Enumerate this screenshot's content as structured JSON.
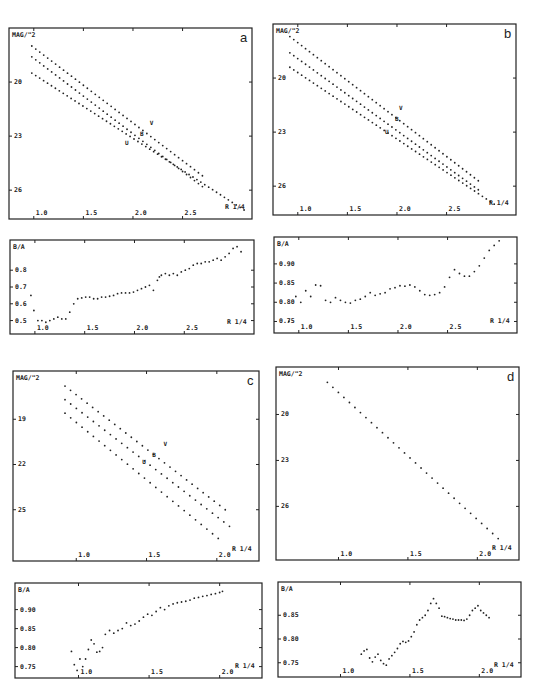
{
  "chart_data": [
    {
      "id": "a-profile",
      "panel_label": "a",
      "type": "scatter",
      "title": "",
      "xlabel": "R 1/4",
      "ylabel": "MAG/\"2",
      "xlim": [
        0.75,
        3.2
      ],
      "ylim": [
        17.0,
        27.6
      ],
      "y_inverted": true,
      "x_ticks": [
        1.0,
        1.5,
        2.0,
        2.5
      ],
      "x_tick_labels": [
        "1.0",
        "1.5",
        "2.0",
        "2.5"
      ],
      "y_ticks": [
        20,
        23,
        26
      ],
      "y_tick_labels": [
        "20",
        "23",
        "26"
      ],
      "band_labels": [
        {
          "text": "V",
          "x": 2.17,
          "y": 22.4
        },
        {
          "text": "B",
          "x": 2.07,
          "y": 23.0
        },
        {
          "text": "U",
          "x": 1.92,
          "y": 23.5
        }
      ],
      "series": [
        {
          "name": "U",
          "x_start": 0.98,
          "x_end": 2.7,
          "y_start": 18.0,
          "y_end": 25.2
        },
        {
          "name": "B",
          "x_start": 0.98,
          "x_end": 2.7,
          "y_start": 18.6,
          "y_end": 25.8
        },
        {
          "name": "V",
          "x_start": 0.98,
          "x_end": 3.12,
          "y_start": 19.5,
          "y_end": 27.1
        }
      ]
    },
    {
      "id": "a-ellipticity",
      "panel_label": "",
      "type": "scatter",
      "xlabel": "R 1/4",
      "ylabel": "B/A",
      "xlim": [
        0.75,
        3.2
      ],
      "ylim": [
        0.42,
        0.98
      ],
      "x_ticks": [
        1.0,
        1.5,
        2.0,
        2.5
      ],
      "x_tick_labels": [
        "1.0",
        "1.5",
        "2.0",
        "2.5"
      ],
      "y_ticks": [
        0.5,
        0.6,
        0.7,
        0.8
      ],
      "y_tick_labels": [
        "0.5",
        "0.6",
        "0.7",
        "0.8"
      ],
      "x": [
        0.96,
        0.99,
        1.03,
        1.07,
        1.11,
        1.15,
        1.19,
        1.23,
        1.27,
        1.31,
        1.35,
        1.39,
        1.43,
        1.47,
        1.51,
        1.55,
        1.59,
        1.63,
        1.67,
        1.71,
        1.75,
        1.79,
        1.83,
        1.87,
        1.91,
        1.95,
        1.99,
        2.03,
        2.07,
        2.11,
        2.15,
        2.19,
        2.23,
        2.25,
        2.27,
        2.31,
        2.35,
        2.39,
        2.43,
        2.47,
        2.51,
        2.55,
        2.59,
        2.63,
        2.67,
        2.71,
        2.75,
        2.79,
        2.83,
        2.87,
        2.91,
        2.95,
        2.99,
        3.03,
        3.07
      ],
      "y": [
        0.65,
        0.56,
        0.5,
        0.5,
        0.49,
        0.5,
        0.51,
        0.52,
        0.51,
        0.51,
        0.55,
        0.6,
        0.63,
        0.635,
        0.64,
        0.64,
        0.63,
        0.63,
        0.64,
        0.64,
        0.645,
        0.65,
        0.66,
        0.665,
        0.665,
        0.665,
        0.67,
        0.68,
        0.69,
        0.7,
        0.71,
        0.68,
        0.74,
        0.76,
        0.77,
        0.78,
        0.77,
        0.78,
        0.77,
        0.79,
        0.8,
        0.81,
        0.83,
        0.84,
        0.84,
        0.85,
        0.85,
        0.86,
        0.87,
        0.86,
        0.88,
        0.9,
        0.93,
        0.94,
        0.91
      ]
    },
    {
      "id": "b-profile",
      "panel_label": "b",
      "type": "scatter",
      "xlabel": "R 1/4",
      "ylabel": "MAG/\"2",
      "xlim": [
        0.75,
        3.2
      ],
      "ylim": [
        17.0,
        27.6
      ],
      "y_inverted": true,
      "x_ticks": [
        1.0,
        1.5,
        2.0,
        2.5
      ],
      "x_tick_labels": [
        "1.0",
        "1.5",
        "2.0",
        "2.5"
      ],
      "y_ticks": [
        20,
        23,
        26
      ],
      "y_tick_labels": [
        "20",
        "23",
        "26"
      ],
      "band_labels": [
        {
          "text": "V",
          "x": 2.02,
          "y": 21.8
        },
        {
          "text": "B",
          "x": 1.98,
          "y": 22.4
        },
        {
          "text": "U",
          "x": 1.88,
          "y": 23.1
        }
      ],
      "series": [
        {
          "name": "U",
          "x_start": 0.92,
          "x_end": 2.82,
          "y_start": 17.7,
          "y_end": 25.7
        },
        {
          "name": "B",
          "x_start": 0.92,
          "x_end": 2.82,
          "y_start": 18.6,
          "y_end": 26.2
        },
        {
          "name": "V",
          "x_start": 0.92,
          "x_end": 2.98,
          "y_start": 19.4,
          "y_end": 27.0
        }
      ]
    },
    {
      "id": "b-ellipticity",
      "panel_label": "",
      "type": "scatter",
      "xlabel": "R 1/4",
      "ylabel": "B/A",
      "xlim": [
        0.75,
        3.2
      ],
      "ylim": [
        0.72,
        0.97
      ],
      "x_ticks": [
        1.0,
        1.5,
        2.0,
        2.5
      ],
      "x_tick_labels": [
        "1.0",
        "1.5",
        "2.0",
        "2.5"
      ],
      "y_ticks": [
        0.75,
        0.8,
        0.85,
        0.9
      ],
      "y_tick_labels": [
        "0.75",
        "0.80",
        "0.85",
        "0.90"
      ],
      "x": [
        0.9,
        0.97,
        1.02,
        1.07,
        1.12,
        1.17,
        1.22,
        1.27,
        1.32,
        1.37,
        1.42,
        1.47,
        1.52,
        1.57,
        1.62,
        1.67,
        1.72,
        1.77,
        1.82,
        1.87,
        1.92,
        1.97,
        2.02,
        2.07,
        2.12,
        2.17,
        2.22,
        2.27,
        2.32,
        2.37,
        2.42,
        2.47,
        2.52,
        2.57,
        2.62,
        2.67,
        2.72,
        2.77,
        2.82,
        2.87,
        2.92,
        2.97,
        3.02
      ],
      "y": [
        0.75,
        0.815,
        0.8,
        0.83,
        0.815,
        0.845,
        0.843,
        0.805,
        0.8,
        0.812,
        0.805,
        0.8,
        0.798,
        0.805,
        0.808,
        0.815,
        0.825,
        0.818,
        0.822,
        0.825,
        0.835,
        0.838,
        0.843,
        0.842,
        0.845,
        0.84,
        0.83,
        0.82,
        0.818,
        0.82,
        0.825,
        0.84,
        0.865,
        0.885,
        0.875,
        0.868,
        0.868,
        0.88,
        0.895,
        0.915,
        0.935,
        0.948,
        0.96
      ]
    },
    {
      "id": "c-profile",
      "panel_label": "c",
      "type": "scatter",
      "xlabel": "R 1/4",
      "ylabel": "MAG/\"2",
      "xlim": [
        0.55,
        2.3
      ],
      "ylim": [
        15.8,
        28.4
      ],
      "y_inverted": true,
      "x_ticks": [
        1.0,
        1.5,
        2.0
      ],
      "x_tick_labels": [
        "1.0",
        "1.5",
        "2.0"
      ],
      "y_ticks": [
        19,
        22,
        25
      ],
      "y_tick_labels": [
        "19",
        "22",
        "25"
      ],
      "band_labels": [
        {
          "text": "V",
          "x": 1.62,
          "y": 20.8
        },
        {
          "text": "B",
          "x": 1.54,
          "y": 21.5
        },
        {
          "text": "U",
          "x": 1.47,
          "y": 22.0
        }
      ],
      "series": [
        {
          "name": "U",
          "x_start": 0.92,
          "x_end": 2.06,
          "y_start": 16.8,
          "y_end": 25.0
        },
        {
          "name": "B",
          "x_start": 0.92,
          "x_end": 2.09,
          "y_start": 17.7,
          "y_end": 26.1
        },
        {
          "name": "V",
          "x_start": 0.92,
          "x_end": 2.01,
          "y_start": 18.6,
          "y_end": 26.9
        }
      ]
    },
    {
      "id": "c-ellipticity",
      "panel_label": "",
      "type": "scatter",
      "xlabel": "R 1/4",
      "ylabel": "B/A",
      "xlim": [
        0.55,
        2.3
      ],
      "ylim": [
        0.72,
        0.97
      ],
      "x_ticks": [
        1.0,
        1.5,
        2.0
      ],
      "x_tick_labels": [
        "1.0",
        "1.5",
        "2.0"
      ],
      "y_ticks": [
        0.75,
        0.8,
        0.85,
        0.9
      ],
      "y_tick_labels": [
        "0.75",
        "0.80",
        "0.85",
        "0.90"
      ],
      "x": [
        0.95,
        0.97,
        0.99,
        1.01,
        1.03,
        1.05,
        1.07,
        1.09,
        1.11,
        1.13,
        1.15,
        1.17,
        1.19,
        1.22,
        1.25,
        1.28,
        1.31,
        1.34,
        1.37,
        1.4,
        1.43,
        1.46,
        1.49,
        1.52,
        1.55,
        1.58,
        1.61,
        1.64,
        1.67,
        1.7,
        1.73,
        1.76,
        1.79,
        1.82,
        1.85,
        1.88,
        1.91,
        1.94,
        1.97,
        2.0,
        2.02
      ],
      "y": [
        0.79,
        0.755,
        0.74,
        0.77,
        0.75,
        0.77,
        0.795,
        0.82,
        0.81,
        0.788,
        0.79,
        0.8,
        0.835,
        0.845,
        0.838,
        0.845,
        0.85,
        0.865,
        0.858,
        0.862,
        0.87,
        0.88,
        0.888,
        0.885,
        0.895,
        0.905,
        0.9,
        0.91,
        0.915,
        0.918,
        0.92,
        0.922,
        0.925,
        0.93,
        0.932,
        0.935,
        0.937,
        0.94,
        0.942,
        0.945,
        0.948
      ]
    },
    {
      "id": "d-profile",
      "panel_label": "d",
      "type": "scatter",
      "xlabel": "R 1/4",
      "ylabel": "MAG/\"2",
      "xlim": [
        0.55,
        2.3
      ],
      "ylim": [
        16.9,
        29.5
      ],
      "y_inverted": true,
      "x_ticks": [
        1.0,
        1.5,
        2.0
      ],
      "x_tick_labels": [
        "1.0",
        "1.5",
        "2.0"
      ],
      "y_ticks": [
        20,
        23,
        26
      ],
      "y_tick_labels": [
        "20",
        "23",
        "26"
      ],
      "band_labels": [],
      "series": [
        {
          "name": "B",
          "x_start": 0.92,
          "x_end": 2.15,
          "y_start": 17.9,
          "y_end": 28.1
        }
      ]
    },
    {
      "id": "d-ellipticity",
      "panel_label": "",
      "type": "scatter",
      "xlabel": "R 1/4",
      "ylabel": "B/A",
      "xlim": [
        0.55,
        2.3
      ],
      "ylim": [
        0.72,
        0.92
      ],
      "x_ticks": [
        1.0,
        1.5,
        2.0
      ],
      "x_tick_labels": [
        "1.0",
        "1.5",
        "2.0"
      ],
      "y_ticks": [
        0.75,
        0.8,
        0.85
      ],
      "y_tick_labels": [
        "0.75",
        "0.80",
        "0.85"
      ],
      "x": [
        1.15,
        1.17,
        1.19,
        1.21,
        1.23,
        1.25,
        1.27,
        1.29,
        1.31,
        1.33,
        1.35,
        1.37,
        1.39,
        1.41,
        1.43,
        1.45,
        1.47,
        1.49,
        1.51,
        1.53,
        1.55,
        1.57,
        1.59,
        1.61,
        1.63,
        1.65,
        1.67,
        1.69,
        1.71,
        1.73,
        1.75,
        1.77,
        1.79,
        1.81,
        1.83,
        1.85,
        1.87,
        1.89,
        1.91,
        1.93,
        1.95,
        1.97,
        1.99,
        2.01,
        2.03,
        2.05,
        2.07
      ],
      "y": [
        0.768,
        0.775,
        0.778,
        0.76,
        0.752,
        0.762,
        0.768,
        0.755,
        0.748,
        0.745,
        0.758,
        0.765,
        0.772,
        0.78,
        0.79,
        0.795,
        0.793,
        0.796,
        0.805,
        0.815,
        0.83,
        0.84,
        0.845,
        0.85,
        0.86,
        0.875,
        0.885,
        0.875,
        0.865,
        0.848,
        0.847,
        0.845,
        0.843,
        0.842,
        0.84,
        0.84,
        0.84,
        0.839,
        0.842,
        0.85,
        0.86,
        0.865,
        0.87,
        0.86,
        0.855,
        0.85,
        0.845
      ]
    }
  ]
}
